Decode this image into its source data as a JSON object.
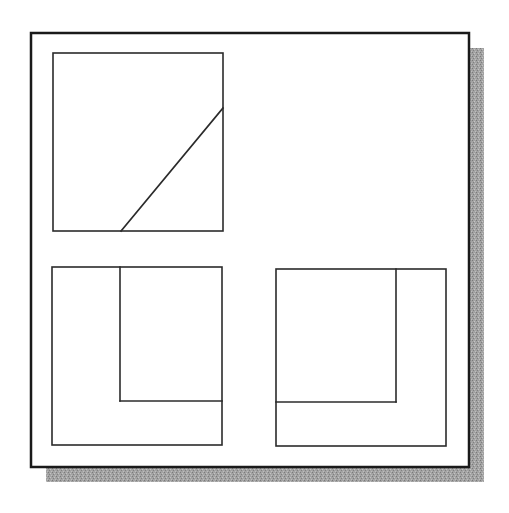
{
  "figure": {
    "colors": {
      "background": "#ffffff",
      "frame": "#1a1a1a",
      "line": "#2b2b2b",
      "shadow": "#9a9a9a"
    },
    "frame": {
      "x": 31,
      "y": 33,
      "w": 438,
      "h": 434,
      "shadow_offset": 15
    },
    "views": [
      {
        "name": "top-view",
        "box": {
          "x": 53,
          "y": 53,
          "w": 170,
          "h": 178
        },
        "lines": [
          {
            "x1": 121,
            "y1": 231,
            "x2": 223,
            "y2": 108
          }
        ]
      },
      {
        "name": "front-view",
        "box": {
          "x": 52,
          "y": 267,
          "w": 170,
          "h": 178
        },
        "lines": [
          {
            "x1": 120,
            "y1": 267,
            "x2": 120,
            "y2": 401
          },
          {
            "x1": 120,
            "y1": 401,
            "x2": 222,
            "y2": 401
          }
        ]
      },
      {
        "name": "side-view",
        "box": {
          "x": 276,
          "y": 269,
          "w": 170,
          "h": 177
        },
        "lines": [
          {
            "x1": 396,
            "y1": 269,
            "x2": 396,
            "y2": 402
          },
          {
            "x1": 276,
            "y1": 402,
            "x2": 396,
            "y2": 402
          }
        ]
      }
    ]
  }
}
